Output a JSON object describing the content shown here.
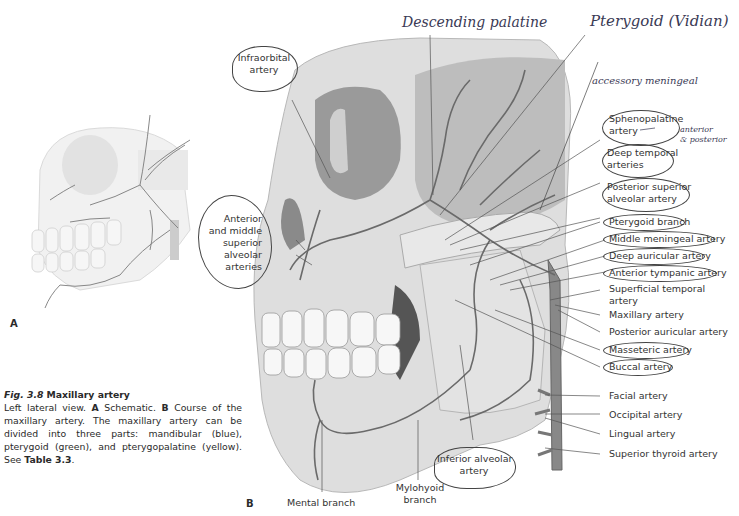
{
  "figure": {
    "number": "Fig. 3.8",
    "title": "Maxillary artery",
    "caption_parts": {
      "intro": "Left lateral view.",
      "a_letter": "A",
      "a_text": "Schematic.",
      "b_letter": "B",
      "b_text": "Course of the maxillary artery. The maxillary artery can be divided into three parts: mandibular (blue), pterygoid (green), and pterygopalatine (yellow). See",
      "table_ref": "Table 3.3",
      "end": "."
    }
  },
  "panels": {
    "a_label": "A",
    "b_label": "B"
  },
  "left_labels": {
    "infraorbital": [
      "Infraorbital",
      "artery"
    ],
    "anterior_middle": [
      "Anterior",
      "and middle",
      "superior",
      "alveolar",
      "arteries"
    ]
  },
  "bottom_labels": {
    "mental": "Mental branch",
    "mylohyoid": [
      "Mylohyoid",
      "branch"
    ],
    "inferior_alveolar": [
      "Inferior alveolar",
      "artery"
    ]
  },
  "right_labels": [
    {
      "id": "sphenopalatine",
      "lines": [
        "Sphenopalatine",
        "artery"
      ],
      "circled": true
    },
    {
      "id": "deep-temporal",
      "lines": [
        "Deep temporal",
        "arteries"
      ],
      "circled": true
    },
    {
      "id": "posterior-superior-alveolar",
      "lines": [
        "Posterior superior",
        "alveolar artery"
      ],
      "circled": true
    },
    {
      "id": "pterygoid-branch",
      "lines": [
        "Pterygoid branch"
      ],
      "circled": true
    },
    {
      "id": "middle-meningeal",
      "lines": [
        "Middle meningeal artery"
      ],
      "circled": true
    },
    {
      "id": "deep-auricular",
      "lines": [
        "Deep auricular artery"
      ],
      "circled": true
    },
    {
      "id": "anterior-tympanic",
      "lines": [
        "Anterior tympanic artery"
      ],
      "circled": true
    },
    {
      "id": "superficial-temporal",
      "lines": [
        "Superficial temporal",
        "artery"
      ],
      "circled": false
    },
    {
      "id": "maxillary",
      "lines": [
        "Maxillary artery"
      ],
      "circled": false
    },
    {
      "id": "posterior-auricular",
      "lines": [
        "Posterior auricular artery"
      ],
      "circled": false
    },
    {
      "id": "masseteric",
      "lines": [
        "Masseteric artery"
      ],
      "circled": true
    },
    {
      "id": "buccal",
      "lines": [
        "Buccal artery"
      ],
      "circled": true
    },
    {
      "id": "facial",
      "lines": [
        "Facial artery"
      ],
      "circled": false
    },
    {
      "id": "occipital",
      "lines": [
        "Occipital artery"
      ],
      "circled": false
    },
    {
      "id": "lingual",
      "lines": [
        "Lingual artery"
      ],
      "circled": false
    },
    {
      "id": "superior-thyroid",
      "lines": [
        "Superior thyroid artery"
      ],
      "circled": false
    }
  ],
  "handwritten": {
    "descending_palatine": "Descending palatine",
    "pterygoid_vidian": "Pterygoid (Vidian)",
    "accessory_meningeal": "accessory meningeal",
    "anterior_posterior": [
      "anterior",
      "& posterior"
    ]
  },
  "colors": {
    "bone": "#dcdcdc",
    "artery": "#6a6a6a",
    "leader": "#555555",
    "ink": "#3a3a55"
  }
}
